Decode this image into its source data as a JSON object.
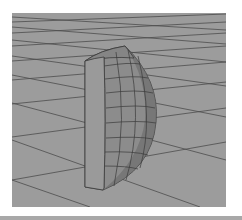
{
  "viewport": {
    "label": "3D perspective viewport",
    "background_color": "#9c9c9c",
    "grid_line_color": "#4a4a4a",
    "object": {
      "name": "half-cylinder mesh",
      "flat_face_color": "#9a9a9a",
      "curved_face_color": "#8a8a8a",
      "wire_color": "#3c3c3c"
    }
  }
}
